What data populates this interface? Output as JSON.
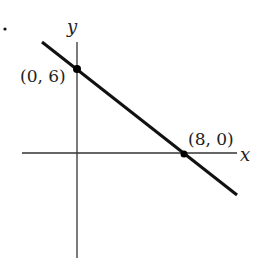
{
  "diagram": {
    "type": "coordinate-graph",
    "axes": {
      "x_label": "x",
      "y_label": "y"
    },
    "line": {
      "slope": -0.75,
      "y_intercept": 6,
      "x_intercept": 8
    },
    "points": [
      {
        "label": "(0, 6)",
        "x": 0,
        "y": 6
      },
      {
        "label": "(8, 0)",
        "x": 8,
        "y": 0
      }
    ],
    "colors": {
      "axis": "#333333",
      "line": "#111111",
      "point": "#000000"
    }
  }
}
